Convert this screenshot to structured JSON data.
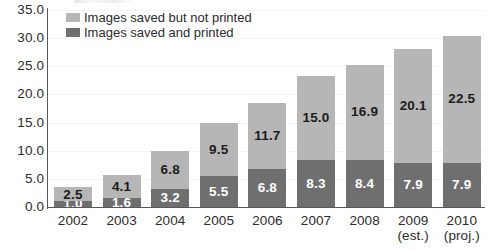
{
  "chart_data": {
    "type": "bar",
    "stacked": true,
    "title": "",
    "xlabel": "",
    "ylabel": "",
    "ylim": [
      0.0,
      35.0
    ],
    "ytick_step": 5.0,
    "ytick_labels": [
      "0.0",
      "5.0",
      "10.0",
      "15.0",
      "20.0",
      "25.0",
      "30.0",
      "35.0"
    ],
    "ytick_values": [
      0.0,
      5.0,
      10.0,
      15.0,
      20.0,
      25.0,
      30.0,
      35.0
    ],
    "grid": true,
    "legend_position": "top-left",
    "categories": [
      "2002",
      "2003",
      "2004",
      "2005",
      "2006",
      "2007",
      "2008",
      "2009",
      "2010"
    ],
    "category_sublabels": [
      "",
      "",
      "",
      "",
      "",
      "",
      "",
      "(est.)",
      "(proj.)"
    ],
    "series": [
      {
        "name": "Images saved and printed",
        "color": "#6f6f70",
        "stack_position": "bottom",
        "values": [
          1.0,
          1.6,
          3.2,
          5.5,
          6.8,
          8.3,
          8.4,
          7.9,
          7.9
        ],
        "labels": [
          "1.0",
          "1.6",
          "3.2",
          "5.5",
          "6.8",
          "8.3",
          "8.4",
          "7.9",
          "7.9"
        ]
      },
      {
        "name": "Images saved but not printed",
        "color": "#b6b6b6",
        "stack_position": "top",
        "values": [
          2.5,
          4.1,
          6.8,
          9.5,
          11.7,
          15.0,
          16.9,
          20.1,
          22.5
        ],
        "labels": [
          "2.5",
          "4.1",
          "6.8",
          "9.5",
          "11.7",
          "15.0",
          "16.9",
          "20.1",
          "22.5"
        ]
      }
    ],
    "totals": [
      3.5,
      5.7,
      10.0,
      15.0,
      18.5,
      23.3,
      25.3,
      28.0,
      30.4
    ]
  },
  "legend": {
    "items": [
      {
        "label": "Images saved but not printed",
        "color": "#b6b6b6"
      },
      {
        "label": "Images saved and printed",
        "color": "#6f6f70"
      }
    ]
  },
  "colors": {
    "series_light": "#b6b6b6",
    "series_dark": "#6f6f70",
    "axis": "#58585a",
    "text": "#2b2b2b",
    "label_on_dark": "#ffffff",
    "background": "#ffffff"
  }
}
